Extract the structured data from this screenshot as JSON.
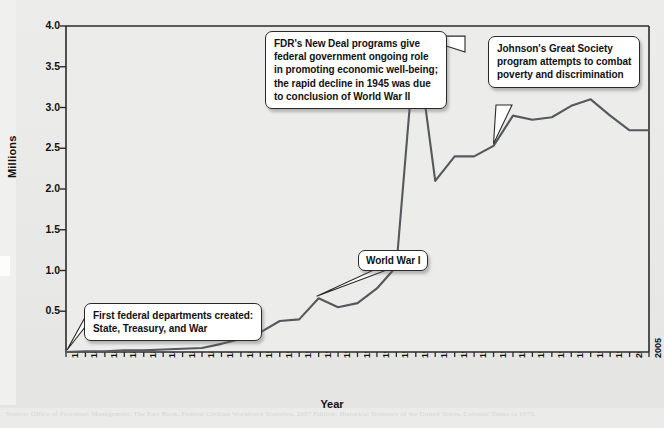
{
  "figure": {
    "caption_ghost": "Source: Office of Personnel Management. The Fact Book, Federal Civilian Workforce Statistics, 2007 Edition; Historical Statistics of the United States, Colonial Times to 1970."
  },
  "chart_data": {
    "type": "line",
    "title": "",
    "xlabel": "Year",
    "ylabel": "Millions",
    "ylim": [
      0,
      4.0
    ],
    "yticks": [
      "0.5",
      "1.0",
      "1.5",
      "2.0",
      "2.5",
      "3.0",
      "3.5",
      "4.0"
    ],
    "ytick_values": [
      0.5,
      1.0,
      1.5,
      2.0,
      2.5,
      3.0,
      3.5,
      4.0
    ],
    "xtick_labels": [
      "1789",
      "1816",
      "1821",
      "1831",
      "1841",
      "1851",
      "1861",
      "1871",
      "1881",
      "1891",
      "1901",
      "1910",
      "1915",
      "1920",
      "1925",
      "1930",
      "1935",
      "1940",
      "1945",
      "1950",
      "1955",
      "1960",
      "1965",
      "1970",
      "1975",
      "1980",
      "1985",
      "1990",
      "1995",
      "2000",
      "2005"
    ],
    "grid": false,
    "legend": "none",
    "line_color": "#55585c",
    "x": [
      1789,
      1816,
      1821,
      1831,
      1841,
      1851,
      1861,
      1871,
      1881,
      1891,
      1901,
      1910,
      1915,
      1920,
      1925,
      1930,
      1935,
      1940,
      1945,
      1950,
      1955,
      1960,
      1965,
      1970,
      1975,
      1980,
      1985,
      1990,
      1995,
      2000,
      2005
    ],
    "values": [
      0.0,
      0.01,
      0.01,
      0.02,
      0.02,
      0.03,
      0.04,
      0.05,
      0.1,
      0.16,
      0.24,
      0.38,
      0.4,
      0.66,
      0.55,
      0.6,
      0.78,
      1.05,
      3.9,
      2.1,
      2.4,
      2.4,
      2.53,
      2.9,
      2.85,
      2.88,
      3.02,
      3.1,
      2.9,
      2.72,
      2.72
    ]
  },
  "annotations": [
    {
      "id": "fdr",
      "lines": [
        "FDR's New Deal programs give",
        "federal government ongoing role",
        "in promoting economic well-being;",
        "the rapid decline in 1945 was due",
        "to conclusion of World War II"
      ]
    },
    {
      "id": "johnson",
      "lines": [
        "Johnson's Great Society",
        "program attempts to combat",
        "poverty and discrimination"
      ]
    },
    {
      "id": "ww1",
      "lines": [
        "World War I"
      ]
    },
    {
      "id": "first-departments",
      "lines": [
        "First federal departments created:",
        "State, Treasury, and War"
      ]
    }
  ]
}
